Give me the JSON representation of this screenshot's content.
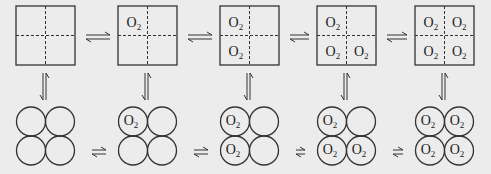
{
  "diagram": {
    "title": "",
    "ligand_label": "O",
    "ligand_subscript": "2",
    "colors": {
      "stroke": "#333333",
      "background": "#ececec"
    },
    "top_row": {
      "shape": "square-divided",
      "states": [
        {
          "id": "T0",
          "occupied": [
            false,
            false,
            false,
            false
          ]
        },
        {
          "id": "T1",
          "occupied": [
            true,
            false,
            false,
            false
          ]
        },
        {
          "id": "T2",
          "occupied": [
            true,
            false,
            true,
            false
          ]
        },
        {
          "id": "T3",
          "occupied": [
            true,
            false,
            true,
            true
          ]
        },
        {
          "id": "T4",
          "occupied": [
            true,
            true,
            true,
            true
          ]
        }
      ]
    },
    "bottom_row": {
      "shape": "four-circles",
      "states": [
        {
          "id": "R0",
          "occupied": [
            false,
            false,
            false,
            false
          ]
        },
        {
          "id": "R1",
          "occupied": [
            true,
            false,
            false,
            false
          ]
        },
        {
          "id": "R2",
          "occupied": [
            true,
            false,
            true,
            false
          ]
        },
        {
          "id": "R3",
          "occupied": [
            true,
            false,
            true,
            true
          ]
        },
        {
          "id": "R4",
          "occupied": [
            true,
            true,
            true,
            true
          ]
        }
      ]
    },
    "arrows": {
      "horizontal": "equilibrium",
      "vertical": "equilibrium"
    }
  }
}
